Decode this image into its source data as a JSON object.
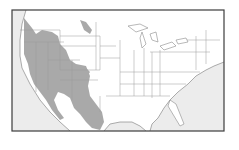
{
  "map": {
    "width": 239,
    "height": 150,
    "frame": {
      "x": 12,
      "y": 10,
      "w": 212,
      "h": 121
    },
    "colors": {
      "background": "#ffffff",
      "ocean": "#ececec",
      "land": "#ffffff",
      "range": "#a9a9a9",
      "border": "#8a8a8a",
      "state_line": "#9a9a9a",
      "frame": "#3c3c3c"
    },
    "regions": {
      "ocean_west": "M12,10 L26,10 L22,24 L20,40 L20,56 L22,68 L30,84 L40,100 L50,112 L60,122 L70,131 L12,131 Z",
      "ocean_east": "M224,62 L224,131 L150,131 L152,124 L158,118 L164,108 L170,100 L178,92 L188,84 L196,76 L206,70 L214,66 Z",
      "gulf": "M110,124 L120,122 L132,122 L140,126 L146,131 L104,131 Z",
      "range_main": "M24,18 L32,28 L36,34 L42,30 L52,32 L58,36 L60,44 L66,50 L70,60 L76,64 L86,66 L90,76 L88,86 L90,96 L96,104 L102,112 L104,122 L100,130 L92,128 L86,122 L80,114 L74,108 L70,98 L64,94 L58,92 L54,100 L58,110 L64,118 L60,120 L52,110 L46,100 L40,92 L34,84 L30,74 L28,64 L24,54 L24,40 Z",
      "range_patch_mt": "M80,20 L86,22 L92,30 L90,34 L84,30 Z",
      "range_patch_tx": "M78,70 L84,66 L90,72 L86,78 Z"
    },
    "state_lines": [
      "M20,30 L60,30",
      "M24,42 L64,42",
      "M36,42 L36,92",
      "M48,42 L48,90",
      "M60,30 L60,70",
      "M48,60 L80,60",
      "M60,46 L96,46",
      "M60,36 L100,36",
      "M96,22 L96,70",
      "M100,36 L100,70",
      "M72,60 L72,100",
      "M60,70 L100,70",
      "M60,80 L98,80",
      "M100,46 L116,46",
      "M100,58 L120,58",
      "M120,40 L120,96",
      "M134,50 L134,96",
      "M144,48 L144,96",
      "M152,52 L152,98",
      "M160,50 L160,96",
      "M120,72 L200,72",
      "M120,84 L186,84",
      "M106,96 L170,96",
      "M100,96 L100,112",
      "M150,52 L210,52",
      "M180,40 L220,40",
      "M196,36 L196,70",
      "M206,30 L206,64"
    ],
    "coast_outline": "M26,10 L22,24 L20,40 L20,56 L22,68 L30,84 L40,100 L50,112 L60,122 L70,131 M104,131 L110,124 L120,122 L132,122 L140,126 L146,131 M150,131 L152,124 L158,118 L164,108 L170,100 L178,92 L188,84 L196,76 L206,70 L214,66 L224,62",
    "great_lakes": [
      "M128,26 L140,24 L148,28 L136,32 Z",
      "M142,32 L146,44 L142,48 L140,38 Z",
      "M150,34 L156,32 L158,42 L152,40 Z",
      "M160,46 L172,42 L176,46 L164,50 Z",
      "M176,40 L186,38 L188,42 L178,44 Z"
    ],
    "florida": "M170,100 L176,104 L180,114 L184,124 L180,126 L174,116 L168,106 Z"
  }
}
